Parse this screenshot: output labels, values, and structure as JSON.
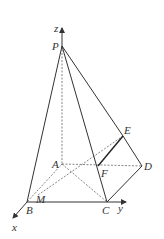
{
  "diagram": {
    "type": "3d-pyramid-geometry",
    "points": {
      "P": {
        "label": "P",
        "x": 62,
        "y": 46
      },
      "A": {
        "label": "A",
        "x": 62,
        "y": 164
      },
      "B": {
        "label": "B",
        "x": 27,
        "y": 202
      },
      "C": {
        "label": "C",
        "x": 107,
        "y": 202
      },
      "D": {
        "label": "D",
        "x": 142,
        "y": 166
      },
      "E": {
        "label": "E",
        "x": 123,
        "y": 136
      },
      "F": {
        "label": "F",
        "x": 98,
        "y": 166
      },
      "M": {
        "label": "M",
        "x": 38,
        "y": 195
      }
    },
    "axes": {
      "x": {
        "label": "x"
      },
      "y": {
        "label": "y"
      },
      "z": {
        "label": "z"
      }
    },
    "solid_edges": [
      "PB",
      "PC",
      "PE",
      "BC",
      "CD",
      "DE",
      "EF"
    ],
    "dashed_edges": [
      "PA",
      "AB",
      "AC",
      "AD",
      "ME"
    ]
  }
}
